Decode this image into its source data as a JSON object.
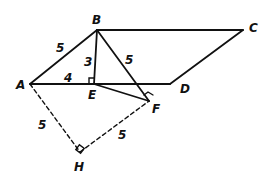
{
  "diagram": {
    "type": "geometry",
    "points": {
      "A": {
        "label": "A",
        "x": 30,
        "y": 84
      },
      "B": {
        "label": "B",
        "x": 97,
        "y": 30
      },
      "C": {
        "label": "C",
        "x": 243,
        "y": 30
      },
      "D": {
        "label": "D",
        "x": 170,
        "y": 84
      },
      "E": {
        "label": "E",
        "x": 94,
        "y": 84
      },
      "F": {
        "label": "F",
        "x": 149,
        "y": 101
      },
      "H": {
        "label": "H",
        "x": 80,
        "y": 152
      }
    },
    "segments": [
      {
        "from": "A",
        "to": "B",
        "style": "solid",
        "length_label": "5"
      },
      {
        "from": "B",
        "to": "C",
        "style": "solid"
      },
      {
        "from": "C",
        "to": "D",
        "style": "solid"
      },
      {
        "from": "A",
        "to": "D",
        "style": "solid"
      },
      {
        "from": "B",
        "to": "E",
        "style": "solid",
        "length_label": "3"
      },
      {
        "from": "B",
        "to": "F",
        "style": "solid",
        "length_label": "5"
      },
      {
        "from": "E",
        "to": "F",
        "style": "solid"
      },
      {
        "from": "A",
        "to": "H",
        "style": "dashed",
        "length_label": "5"
      },
      {
        "from": "H",
        "to": "F",
        "style": "dashed",
        "length_label": "5"
      }
    ],
    "measurements": {
      "AB": "5",
      "AE": "4",
      "BE": "3",
      "BF": "5",
      "AH": "5",
      "HF": "5"
    },
    "right_angles": [
      "E",
      "F",
      "H"
    ],
    "stroke_color": "#111111",
    "background_color": "#ffffff"
  }
}
